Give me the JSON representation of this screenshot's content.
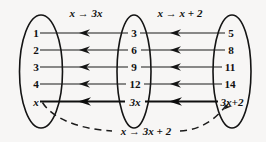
{
  "diagram": {
    "background_color": "#f7f6f5",
    "ink_color": "#141414",
    "rules": {
      "first": "x → 3x",
      "second": "x → x + 2",
      "composite": "x → 3x + 2"
    },
    "sets": {
      "domain": {
        "name": "domain-set",
        "elements": [
          "1",
          "2",
          "3",
          "4",
          "x"
        ]
      },
      "intermediate": {
        "name": "intermediate-set",
        "elements": [
          "3",
          "6",
          "9",
          "12",
          "3x"
        ]
      },
      "codomain": {
        "name": "codomain-set",
        "elements": [
          "5",
          "8",
          "11",
          "14",
          "3x+2"
        ]
      }
    },
    "mappings_first": [
      {
        "from": "1",
        "to": "3"
      },
      {
        "from": "2",
        "to": "6"
      },
      {
        "from": "3",
        "to": "9"
      },
      {
        "from": "4",
        "to": "12"
      },
      {
        "from": "x",
        "to": "3x"
      }
    ],
    "mappings_second": [
      {
        "from": "3",
        "to": "5"
      },
      {
        "from": "6",
        "to": "8"
      },
      {
        "from": "9",
        "to": "11"
      },
      {
        "from": "12",
        "to": "14"
      },
      {
        "from": "3x",
        "to": "3x+2"
      }
    ],
    "composite_mapping": {
      "from": "x",
      "to": "3x+2",
      "style": "dashed"
    }
  }
}
